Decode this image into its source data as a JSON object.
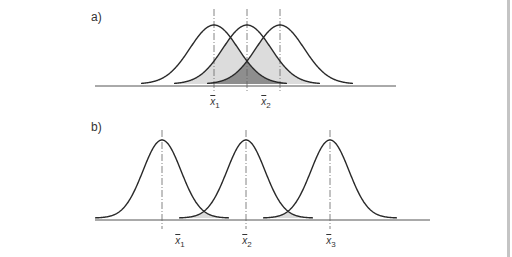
{
  "colors": {
    "line": "#2a2a2a",
    "axis": "#555555",
    "dash": "#666666",
    "shade_light": "#dcdcdc",
    "shade_dark": "#8e8e8e",
    "border": "#c4c4c4"
  },
  "panels": [
    {
      "id": "a",
      "label": "a)",
      "label_pos": [
        91,
        10
      ],
      "baseline": {
        "y": 86,
        "x1": 95,
        "x2": 396
      },
      "peak_y": 25,
      "curve_bottom_y": 84,
      "half_width": 73,
      "sigma": 24,
      "dash_top": 9,
      "dash_bottom": 93,
      "means": [
        214,
        247,
        280
      ],
      "shading": "pairwise_and_triple_overlap",
      "mean_labels": [
        {
          "base": "x",
          "sub": "1",
          "x": 215,
          "y": 96
        },
        {
          "base": "x",
          "sub": "2",
          "x": 266,
          "y": 96
        }
      ]
    },
    {
      "id": "b",
      "label": "b)",
      "label_pos": [
        91,
        120
      ],
      "baseline": {
        "y": 220,
        "x1": 95,
        "x2": 430
      },
      "peak_y": 140,
      "curve_bottom_y": 218,
      "half_width": 67,
      "sigma": 19,
      "dash_top": 130,
      "dash_bottom": 229,
      "means": [
        162,
        246,
        330
      ],
      "shading": "adjacent_overlap",
      "mean_labels": [
        {
          "base": "x",
          "sub": "1",
          "x": 180,
          "y": 235
        },
        {
          "base": "x",
          "sub": "2",
          "x": 247,
          "y": 235
        },
        {
          "base": "x",
          "sub": "3",
          "x": 331,
          "y": 235
        }
      ]
    }
  ]
}
